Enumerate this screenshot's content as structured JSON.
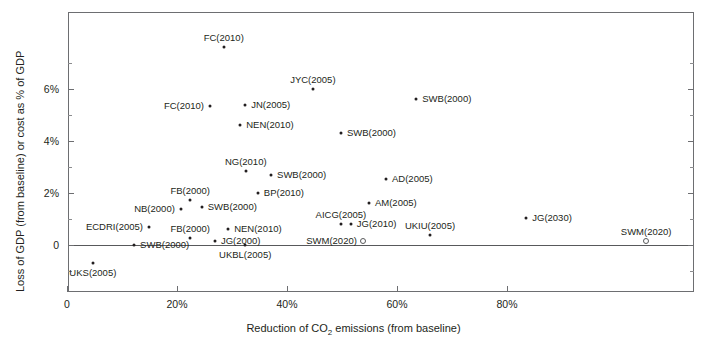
{
  "chart_data": {
    "type": "scatter",
    "title": "",
    "xlabel": "Reduction of CO2 emissions (from baseline)",
    "xlabel_parts": {
      "pre": "Reduction of CO",
      "sub": "2",
      "post": " emissions (from baseline)"
    },
    "ylabel": "Loss of GDP (from baseline) or cost as % of GDP",
    "xlim": [
      -3,
      111
    ],
    "ylim": [
      -2.2,
      8.5
    ],
    "xticks": [
      0,
      20,
      40,
      60,
      80
    ],
    "xticklabels": [
      "0",
      "20%",
      "40%",
      "60%",
      "80%"
    ],
    "yticks": [
      0,
      2,
      4,
      6
    ],
    "yticklabels": [
      "0",
      "2%",
      "4%",
      "6%"
    ],
    "grid": false,
    "legend": null,
    "marker_styles": [
      "filled",
      "open"
    ],
    "points": [
      {
        "label": "FC(2010)",
        "x": 28.5,
        "y": 7.6,
        "style": "filled",
        "lpos": "t"
      },
      {
        "label": "JYC(2005)",
        "x": 44.7,
        "y": 6.0,
        "style": "filled",
        "lpos": "t"
      },
      {
        "label": "FC(2010)",
        "x": 26.0,
        "y": 5.35,
        "style": "filled",
        "lpos": "l"
      },
      {
        "label": "JN(2005)",
        "x": 32.4,
        "y": 5.4,
        "style": "filled",
        "lpos": "r"
      },
      {
        "label": "SWB(2000)",
        "x": 63.5,
        "y": 5.6,
        "style": "filled",
        "lpos": "r"
      },
      {
        "label": "NEN(2010)",
        "x": 31.5,
        "y": 4.6,
        "style": "filled",
        "lpos": "r"
      },
      {
        "label": "SWB(2000)",
        "x": 49.8,
        "y": 4.3,
        "style": "filled",
        "lpos": "r"
      },
      {
        "label": "NG(2010)",
        "x": 32.5,
        "y": 2.85,
        "style": "filled",
        "lpos": "t"
      },
      {
        "label": "SWB(2000)",
        "x": 37.1,
        "y": 2.7,
        "style": "filled",
        "lpos": "r"
      },
      {
        "label": "AD(2005)",
        "x": 58.0,
        "y": 2.55,
        "style": "filled",
        "lpos": "r"
      },
      {
        "label": "FB(2000)",
        "x": 22.4,
        "y": 1.75,
        "style": "filled",
        "lpos": "t"
      },
      {
        "label": "BP(2010)",
        "x": 34.7,
        "y": 2.0,
        "style": "filled",
        "lpos": "r"
      },
      {
        "label": "AM(2005)",
        "x": 54.9,
        "y": 1.6,
        "style": "filled",
        "lpos": "r"
      },
      {
        "label": "NB(2000)",
        "x": 20.7,
        "y": 1.4,
        "style": "filled",
        "lpos": "l"
      },
      {
        "label": "SWB(2000)",
        "x": 24.5,
        "y": 1.45,
        "style": "filled",
        "lpos": "r"
      },
      {
        "label": "AICG(2005)",
        "x": 49.8,
        "y": 0.8,
        "style": "filled",
        "lpos": "t"
      },
      {
        "label": "JG(2010)",
        "x": 51.6,
        "y": 0.8,
        "style": "filled",
        "lpos": "r"
      },
      {
        "label": "ECDRI(2005)",
        "x": 14.9,
        "y": 0.7,
        "style": "filled",
        "lpos": "l"
      },
      {
        "label": "NEN(2010)",
        "x": 29.3,
        "y": 0.6,
        "style": "filled",
        "lpos": "r"
      },
      {
        "label": "JG(2030)",
        "x": 83.5,
        "y": 1.05,
        "style": "filled",
        "lpos": "r"
      },
      {
        "label": "UKIU(2005)",
        "x": 66.0,
        "y": 0.4,
        "style": "filled",
        "lpos": "t"
      },
      {
        "label": "FB(2000)",
        "x": 22.4,
        "y": 0.27,
        "style": "filled",
        "lpos": "t"
      },
      {
        "label": "SWM(2020)",
        "x": 53.8,
        "y": 0.15,
        "style": "open",
        "lpos": "l"
      },
      {
        "label": "SWM(2020)",
        "x": 105.3,
        "y": 0.15,
        "style": "open",
        "lpos": "t"
      },
      {
        "label": "JG(2000)",
        "x": 26.9,
        "y": 0.16,
        "style": "filled",
        "lpos": "r"
      },
      {
        "label": "SWB(2000)",
        "x": 12.2,
        "y": 0.0,
        "style": "filled",
        "lpos": "r"
      },
      {
        "label": "UKBL(2005)",
        "x": 32.4,
        "y": 0.0,
        "style": "filled",
        "lpos": "b"
      },
      {
        "label": "UKS(2005)",
        "x": 4.7,
        "y": -0.7,
        "style": "filled",
        "lpos": "b"
      }
    ]
  }
}
